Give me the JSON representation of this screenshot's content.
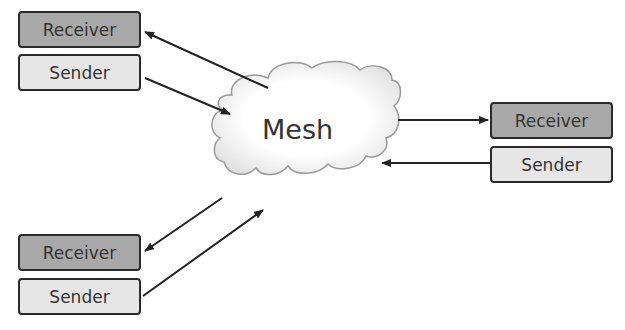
{
  "mesh": {
    "label": "Mesh"
  },
  "nodes": [
    {
      "id": "top-left",
      "receiver_label": "Receiver",
      "sender_label": "Sender"
    },
    {
      "id": "right",
      "receiver_label": "Receiver",
      "sender_label": "Sender"
    },
    {
      "id": "bottom-left",
      "receiver_label": "Receiver",
      "sender_label": "Sender"
    }
  ],
  "colors": {
    "receiver_fill": "#a8a8a8",
    "sender_fill": "#e6e6e6",
    "border": "#2a2a2a"
  }
}
